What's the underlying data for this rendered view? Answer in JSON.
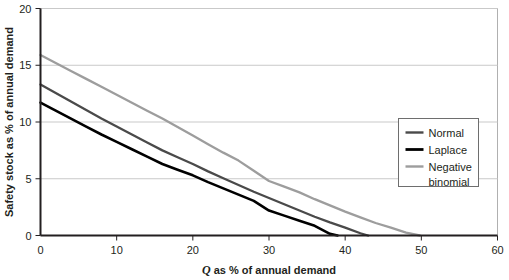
{
  "chart_data": {
    "type": "line",
    "title": "",
    "xlabel": "Q as % of annual demand",
    "xlabel_italic_prefix": "Q",
    "xlabel_rest": " as % of annual demand",
    "ylabel": "Safety stock as % of annual demand",
    "xlim": [
      0,
      60
    ],
    "ylim": [
      0,
      20
    ],
    "xticks": [
      0,
      10,
      20,
      30,
      40,
      50,
      60
    ],
    "yticks": [
      0,
      5,
      10,
      15,
      20
    ],
    "xtick_labels": [
      "0",
      "10",
      "20",
      "30",
      "40",
      "50",
      "60"
    ],
    "ytick_labels": [
      "0",
      "5",
      "10",
      "15",
      "20"
    ],
    "grid": "horizontal",
    "legend_position": "right-middle",
    "series": [
      {
        "name": "Normal",
        "color": "#4a4a4a",
        "x": [
          0,
          2,
          4,
          6,
          8,
          10,
          12,
          14,
          16,
          18,
          20,
          22,
          24,
          26,
          28,
          30,
          32,
          34,
          36,
          38,
          40,
          42,
          43
        ],
        "values": [
          13.3,
          12.55,
          11.8,
          11.05,
          10.3,
          9.6,
          8.9,
          8.2,
          7.5,
          6.9,
          6.3,
          5.65,
          5.05,
          4.45,
          3.85,
          3.3,
          2.75,
          2.2,
          1.65,
          1.15,
          0.7,
          0.2,
          0.0
        ]
      },
      {
        "name": "Laplace",
        "color": "#000000",
        "x": [
          0,
          2,
          4,
          6,
          8,
          10,
          12,
          14,
          16,
          18,
          20,
          22,
          24,
          26,
          28,
          30,
          32,
          34,
          36,
          38,
          39
        ],
        "values": [
          11.7,
          11.0,
          10.3,
          9.6,
          8.9,
          8.25,
          7.6,
          6.95,
          6.3,
          5.8,
          5.3,
          4.7,
          4.15,
          3.6,
          3.05,
          2.2,
          1.75,
          1.3,
          0.85,
          0.15,
          0.0
        ]
      },
      {
        "name": "Negative binomial",
        "color": "#9d9d9d",
        "x": [
          0,
          2,
          4,
          6,
          8,
          10,
          12,
          14,
          16,
          18,
          20,
          22,
          24,
          26,
          28,
          30,
          32,
          34,
          36,
          38,
          40,
          42,
          44,
          46,
          48,
          49.8
        ],
        "values": [
          15.9,
          15.2,
          14.5,
          13.8,
          13.1,
          12.4,
          11.7,
          11.0,
          10.3,
          9.55,
          8.8,
          8.05,
          7.3,
          6.6,
          5.7,
          4.8,
          4.3,
          3.8,
          3.2,
          2.65,
          2.1,
          1.6,
          1.1,
          0.7,
          0.25,
          0.0
        ]
      }
    ]
  },
  "legend": {
    "entries": [
      {
        "label": "Normal",
        "color": "#4a4a4a",
        "width": 2.4
      },
      {
        "label": "Laplace",
        "color": "#000000",
        "width": 2.8
      },
      {
        "label": "Negative",
        "label2": "binomial",
        "color": "#9d9d9d",
        "width": 2.4
      }
    ]
  },
  "colors": {
    "axis": "#231f20",
    "grid": "#c9c9c9",
    "frame": "#b0b0b0",
    "background": "#ffffff",
    "text": "#231f20"
  }
}
